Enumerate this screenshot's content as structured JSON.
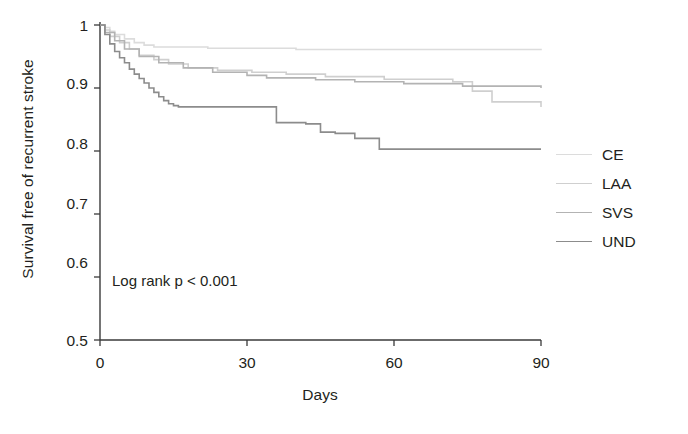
{
  "chart_data": {
    "type": "line",
    "subtype": "kaplan-meier-step",
    "title": "",
    "xlabel": "Days",
    "ylabel": "Survival free of recurrent stroke",
    "xlim": [
      0,
      90
    ],
    "ylim": [
      0.5,
      1.0
    ],
    "xticks": [
      0,
      30,
      60,
      90
    ],
    "xtick_labels": [
      "0",
      "30",
      "60",
      "90"
    ],
    "yticks": [
      0.5,
      0.6,
      0.7,
      0.8,
      0.9,
      1.0
    ],
    "ytick_labels": [
      "0.5",
      "0.6",
      "0.7",
      "0.8",
      "0.9",
      "1"
    ],
    "grid": false,
    "legend_position": "right",
    "annotations": [
      {
        "text": "Log rank p < 0.001",
        "x": 4,
        "y": 0.575
      }
    ],
    "series": [
      {
        "name": "CE",
        "color": "#dcdcdc",
        "final_value": 0.96,
        "x": [
          0,
          1,
          2,
          3,
          5,
          7,
          9,
          11,
          22,
          40,
          90
        ],
        "y": [
          1.0,
          0.996,
          0.99,
          0.985,
          0.978,
          0.972,
          0.968,
          0.965,
          0.963,
          0.961,
          0.96
        ]
      },
      {
        "name": "LAA",
        "color": "#cfcfcf",
        "final_value": 0.87,
        "x": [
          0,
          1,
          2,
          4,
          6,
          8,
          11,
          14,
          18,
          24,
          31,
          38,
          46,
          58,
          72,
          76,
          80,
          90
        ],
        "y": [
          1.0,
          0.992,
          0.982,
          0.972,
          0.962,
          0.952,
          0.945,
          0.938,
          0.932,
          0.928,
          0.925,
          0.922,
          0.918,
          0.914,
          0.91,
          0.895,
          0.878,
          0.87
        ]
      },
      {
        "name": "SVS",
        "color": "#b3b3b3",
        "final_value": 0.9,
        "x": [
          0,
          1,
          3,
          5,
          8,
          12,
          17,
          23,
          30,
          34,
          44,
          52,
          62,
          74,
          90
        ],
        "y": [
          1.0,
          0.988,
          0.975,
          0.962,
          0.95,
          0.94,
          0.932,
          0.925,
          0.92,
          0.916,
          0.913,
          0.91,
          0.907,
          0.903,
          0.9
        ]
      },
      {
        "name": "UND",
        "color": "#8c8c8c",
        "final_value": 0.803,
        "x": [
          0,
          1,
          2,
          3,
          4,
          5,
          6,
          7,
          8,
          9,
          10,
          11,
          12,
          13,
          14,
          15,
          16,
          32,
          36,
          42,
          45,
          48,
          52,
          57,
          90
        ],
        "y": [
          1.0,
          0.985,
          0.97,
          0.958,
          0.948,
          0.94,
          0.93,
          0.922,
          0.915,
          0.908,
          0.9,
          0.893,
          0.886,
          0.88,
          0.875,
          0.872,
          0.87,
          0.87,
          0.845,
          0.843,
          0.83,
          0.828,
          0.82,
          0.803,
          0.803
        ]
      }
    ]
  },
  "legend": {
    "items": [
      {
        "label": "CE"
      },
      {
        "label": "LAA"
      },
      {
        "label": "SVS"
      },
      {
        "label": "UND"
      }
    ]
  },
  "axis_colors": {
    "axis_line": "#3a3a3a",
    "text": "#231f20"
  }
}
